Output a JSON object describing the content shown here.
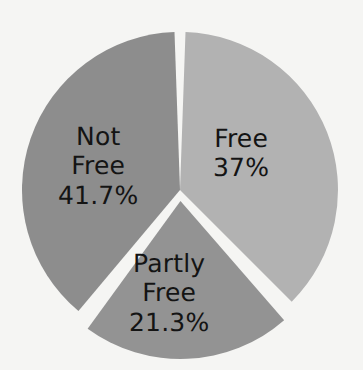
{
  "chart_data": {
    "type": "pie",
    "title": "",
    "subtitle": "",
    "xlabel": "",
    "ylabel": "",
    "grid": false,
    "legend": "none",
    "labels_inside_slices": true,
    "background_color": "#f5f5f3",
    "label_text_color": "#141414",
    "separator_color": "#ffffff",
    "center": [
      180,
      190
    ],
    "radius": 158,
    "categories": [
      "Free",
      "Partly Free",
      "Not Free"
    ],
    "values": [
      37,
      21.3,
      41.7
    ],
    "value_labels": [
      "37%",
      "21.3%",
      "41.7%"
    ],
    "colors": [
      "#b2b2b2",
      "#939393",
      "#8d8d8d"
    ],
    "slices": [
      {
        "name": "Free",
        "label_line1": "Free",
        "label_line2": "37%",
        "value": 37,
        "value_label": "37%",
        "color": "#b2b2b2",
        "start_angle": 2,
        "end_angle": 135,
        "offset": 0
      },
      {
        "name": "Partly Free",
        "label_line1": "Partly",
        "label_line2": "Free",
        "label_line3": "21.3%",
        "value": 21.3,
        "value_label": "21.3%",
        "color": "#939393",
        "start_angle": 139,
        "end_angle": 216,
        "offset": 11
      },
      {
        "name": "Not Free",
        "label_line1": "Not",
        "label_line2": "Free",
        "label_line3": "41.7%",
        "value": 41.7,
        "value_label": "41.7%",
        "color": "#8d8d8d",
        "start_angle": 220,
        "end_angle": 358,
        "offset": 0
      }
    ]
  }
}
